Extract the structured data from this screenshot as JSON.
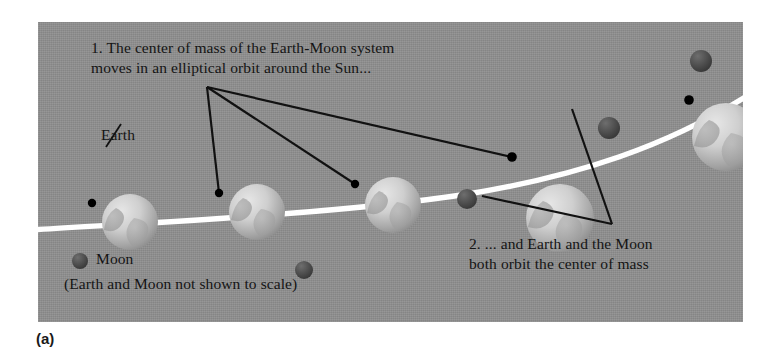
{
  "figure": {
    "subfigure_label": "(a)",
    "panel": {
      "background_color": "#8e8e8e",
      "left": 38,
      "top": 22,
      "width": 705,
      "height": 300
    },
    "annotations": [
      {
        "id": "note-1",
        "line1": "1. The center of mass of the Earth-Moon system",
        "line2": "moves in an elliptical orbit around the Sun..."
      },
      {
        "id": "note-2",
        "line1": "2. ... and Earth and the Moon",
        "line2": "both orbit the center of mass"
      }
    ],
    "labels": {
      "earth": "Earth",
      "moon": "Moon",
      "scale_note": "(Earth and Moon not shown to scale)"
    },
    "legend": {
      "moon_swatch_color": "#4a4a4a"
    },
    "colors": {
      "panel_gray": "#8e8e8e",
      "orbit_line": "#ffffff",
      "leader_line": "#111111",
      "earth_body": "#c9c9c9",
      "moon_body": "#4a4a4a",
      "center_of_mass_dot": "#000000",
      "text": "#141414"
    },
    "orbit": {
      "description": "elliptical-orbit-arc",
      "stroke_width": 5
    },
    "earth_positions": [
      {
        "cx": 92,
        "cy": 200,
        "r": 28
      },
      {
        "cx": 219,
        "cy": 190,
        "r": 28
      },
      {
        "cx": 355,
        "cy": 183,
        "r": 28
      },
      {
        "cx": 522,
        "cy": 196,
        "r": 34
      },
      {
        "cx": 688,
        "cy": 115,
        "r": 34
      }
    ],
    "moon_positions": [
      {
        "cx": 266,
        "cy": 248,
        "r": 9
      },
      {
        "cx": 429,
        "cy": 177,
        "r": 10
      },
      {
        "cx": 571,
        "cy": 106,
        "r": 11
      },
      {
        "cx": 663,
        "cy": 39,
        "r": 11
      }
    ],
    "center_of_mass_dots": [
      {
        "cx": 92,
        "cy": 203
      },
      {
        "cx": 219,
        "cy": 193
      },
      {
        "cx": 355,
        "cy": 184
      },
      {
        "cx": 512,
        "cy": 157
      },
      {
        "cx": 689,
        "cy": 100
      }
    ]
  }
}
